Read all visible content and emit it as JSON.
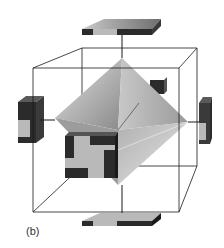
{
  "figure": {
    "panel_label": "(b)",
    "colors": {
      "frame_line": "#1a1a1a",
      "block_dark": "#2b2b2b",
      "block_light": "#b9b9b9",
      "octahedron_light": "#d6d6d6",
      "octahedron_mid": "#a8a8a8",
      "octahedron_dark": "#7a7a7a"
    }
  }
}
